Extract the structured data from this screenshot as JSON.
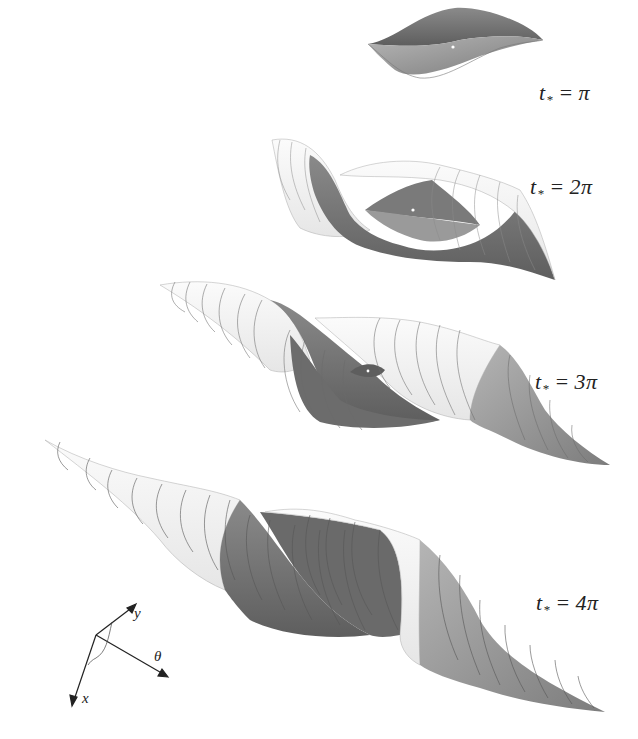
{
  "figure": {
    "panels": [
      {
        "id": "pi",
        "t_var": "t",
        "t_sub": "*",
        "t_value": "π",
        "label_text": "t* = π"
      },
      {
        "id": "2pi",
        "t_var": "t",
        "t_sub": "*",
        "t_value": "2π",
        "label_text": "t* = 2π"
      },
      {
        "id": "3pi",
        "t_var": "t",
        "t_sub": "*",
        "t_value": "3π",
        "label_text": "t* = 3π"
      },
      {
        "id": "4pi",
        "t_var": "t",
        "t_sub": "*",
        "t_value": "4π",
        "label_text": "t* = 4π"
      }
    ],
    "equals": "=",
    "axes": {
      "y": "y",
      "theta": "θ",
      "x": "x"
    },
    "colors": {
      "background": "#ffffff",
      "surface_dark": "#6e6e6e",
      "surface_mid": "#9a9a9a",
      "surface_light": "#f2f2f2",
      "grid_lines": "#555555",
      "text": "#222222"
    }
  }
}
